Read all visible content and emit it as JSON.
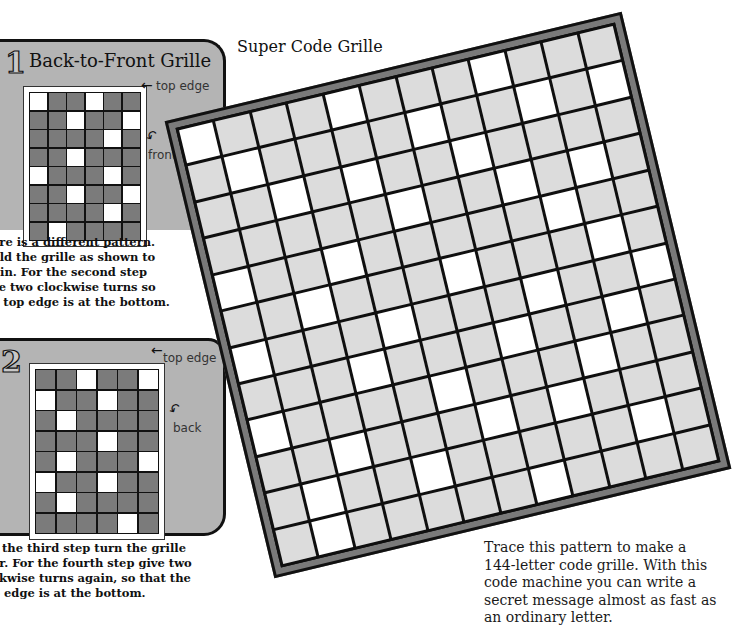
{
  "panel1": {
    "number": "1",
    "title": "Back-to-Front Grille",
    "top_edge_label": "top edge",
    "side_label": "front",
    "grille": {
      "cols": 6,
      "rows": 8,
      "open_cells": [
        [
          0,
          0
        ],
        [
          0,
          3
        ],
        [
          1,
          2
        ],
        [
          1,
          5
        ],
        [
          2,
          4
        ],
        [
          3,
          2
        ],
        [
          4,
          0
        ],
        [
          4,
          4
        ],
        [
          5,
          2
        ],
        [
          5,
          5
        ],
        [
          6,
          4
        ],
        [
          7,
          1
        ]
      ]
    },
    "caption": "ere is a different pattern.\nold the grille as shown to\ngin. For the second step\nve two clockwise turns so\ne top edge is at the bottom."
  },
  "panel2": {
    "number": "2",
    "top_edge_label": "top edge",
    "side_label": "back",
    "grille": {
      "cols": 6,
      "rows": 8,
      "open_cells": [
        [
          0,
          2
        ],
        [
          0,
          5
        ],
        [
          1,
          0
        ],
        [
          1,
          3
        ],
        [
          2,
          1
        ],
        [
          3,
          3
        ],
        [
          4,
          1
        ],
        [
          4,
          5
        ],
        [
          5,
          0
        ],
        [
          5,
          3
        ],
        [
          6,
          1
        ],
        [
          7,
          4
        ]
      ]
    },
    "caption": "r the third step turn the grille\ner. For the fourth step give two\nckwise turns again, so that the\np edge is at the bottom."
  },
  "main": {
    "title": "Super Code Grille",
    "grille": {
      "cols": 12,
      "rows": 12,
      "rotation_deg": -13.5,
      "open_cells": [
        [
          0,
          0
        ],
        [
          0,
          4
        ],
        [
          0,
          8
        ],
        [
          1,
          1
        ],
        [
          1,
          6
        ],
        [
          1,
          9
        ],
        [
          1,
          11
        ],
        [
          2,
          2
        ],
        [
          2,
          4
        ],
        [
          2,
          7
        ],
        [
          3,
          5
        ],
        [
          3,
          8
        ],
        [
          3,
          10
        ],
        [
          4,
          0
        ],
        [
          4,
          3
        ],
        [
          4,
          9
        ],
        [
          5,
          2
        ],
        [
          5,
          6
        ],
        [
          5,
          10
        ],
        [
          6,
          0
        ],
        [
          6,
          4
        ],
        [
          6,
          8
        ],
        [
          6,
          11
        ],
        [
          7,
          3
        ],
        [
          7,
          7
        ],
        [
          7,
          10
        ],
        [
          8,
          0
        ],
        [
          8,
          5
        ],
        [
          8,
          9
        ],
        [
          9,
          2
        ],
        [
          9,
          6
        ],
        [
          9,
          8
        ],
        [
          10,
          1
        ],
        [
          10,
          4
        ],
        [
          10,
          10
        ],
        [
          11,
          1
        ],
        [
          11,
          7
        ]
      ]
    },
    "body_text": "Trace this pattern to make a\n144-letter code grille. With this\ncode machine you can write a\nsecret message almost as fast as\nan ordinary letter."
  },
  "colors": {
    "panel_bg": "#b4b4b4",
    "small_cell_closed": "#7b7b7b",
    "big_cell_closed": "#dcdcdc",
    "cell_open": "#ffffff",
    "frame": "#7a7a7a",
    "ink": "#111111"
  },
  "icons": {
    "arrow_top_edge": "left-arrow-icon",
    "arrow_curved": "curved-arrow-icon"
  }
}
